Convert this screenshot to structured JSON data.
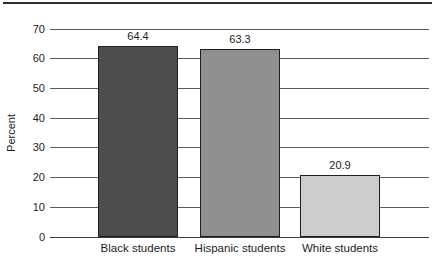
{
  "chart_data": {
    "type": "bar",
    "title": "",
    "xlabel": "",
    "ylabel": "Percent",
    "categories": [
      "Black students",
      "Hispanic students",
      "White students"
    ],
    "values": [
      64.4,
      63.3,
      20.9
    ],
    "value_labels": [
      "64.4",
      "63.3",
      "20.9"
    ],
    "yticks": [
      0,
      10,
      20,
      30,
      40,
      50,
      60,
      70
    ],
    "ylim": [
      0,
      70
    ],
    "grid": "horizontal-full-width",
    "legend": "none",
    "bar_colors": [
      "#4d4d4d",
      "#8f8f8f",
      "#cdcdcd"
    ],
    "bar_border_color": "#1f1f1f"
  },
  "colors": {
    "background": "#ffffff",
    "top_rule": "#2e2e2e",
    "gridline": "#5b5b5b",
    "axis_line": "#3c3c3c",
    "text": "#1c1c1c"
  }
}
